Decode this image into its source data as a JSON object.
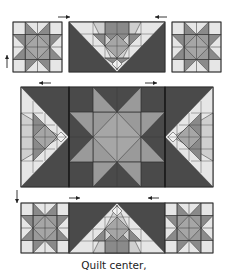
{
  "caption": "Quilt center,",
  "colors": {
    "light": "#e6e6e6",
    "medium": "#9a9a9a",
    "medium_dark": "#8a8a8a",
    "dark": "#4a4a4a",
    "line": "#333333",
    "arrow": "#222222"
  },
  "diagram": {
    "rows": [
      {
        "name": "top-row",
        "blocks": [
          {
            "type": "star",
            "x": 13,
            "y": 22,
            "w": 49,
            "h": 50
          },
          {
            "type": "flying-geese-down",
            "x": 69,
            "y": 22,
            "w": 96,
            "h": 50
          },
          {
            "type": "star",
            "x": 172,
            "y": 22,
            "w": 49,
            "h": 50
          }
        ]
      },
      {
        "name": "middle-row",
        "blocks": [
          {
            "type": "geese-right",
            "x": 21,
            "y": 87,
            "w": 48,
            "h": 100
          },
          {
            "type": "big-star",
            "x": 69,
            "y": 87,
            "w": 96,
            "h": 100
          },
          {
            "type": "geese-left",
            "x": 165,
            "y": 87,
            "w": 48,
            "h": 100
          }
        ]
      },
      {
        "name": "bottom-row",
        "blocks": [
          {
            "type": "star",
            "x": 21,
            "y": 203,
            "w": 48,
            "h": 50
          },
          {
            "type": "flying-geese-up",
            "x": 69,
            "y": 203,
            "w": 96,
            "h": 50
          },
          {
            "type": "star",
            "x": 165,
            "y": 203,
            "w": 48,
            "h": 50
          }
        ]
      }
    ],
    "arrows": [
      {
        "dir": "right",
        "x": 58,
        "y": 17,
        "len": 12
      },
      {
        "dir": "left",
        "x": 167,
        "y": 17,
        "len": 12
      },
      {
        "dir": "up",
        "x": 7,
        "y": 68,
        "len": 13
      },
      {
        "dir": "left",
        "x": 51,
        "y": 83,
        "len": 12
      },
      {
        "dir": "right",
        "x": 145,
        "y": 83,
        "len": 12
      },
      {
        "dir": "down",
        "x": 17,
        "y": 190,
        "len": 13
      },
      {
        "dir": "right",
        "x": 69,
        "y": 198,
        "len": 11
      },
      {
        "dir": "left",
        "x": 159,
        "y": 198,
        "len": 11
      }
    ]
  }
}
